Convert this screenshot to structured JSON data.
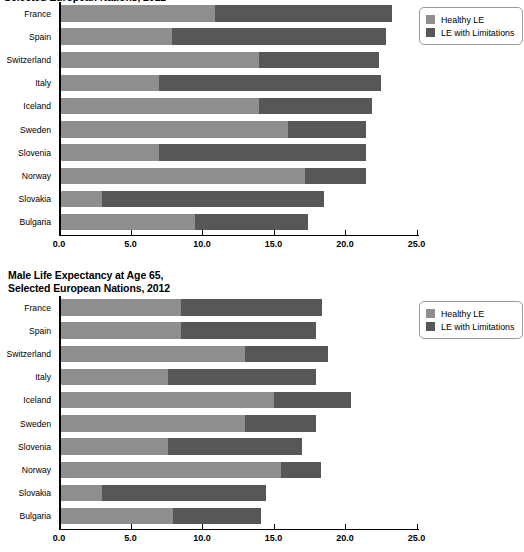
{
  "chart_data": [
    {
      "id": "female",
      "type": "bar",
      "orientation": "horizontal",
      "stacked": true,
      "title": "Female Life Expectancy at Age 65,\nSelected European Nations, 2012",
      "title_visible": false,
      "xlabel": "",
      "ylabel": "",
      "xlim": [
        0.0,
        25.0
      ],
      "xticks": [
        0.0,
        5.0,
        10.0,
        15.0,
        20.0,
        25.0
      ],
      "xtick_labels": [
        "0.0",
        "5.0",
        "10.0",
        "15.0",
        "20.0",
        "25.0"
      ],
      "grid": false,
      "categories": [
        "France",
        "Spain",
        "Switzerland",
        "Italy",
        "Iceland",
        "Sweden",
        "Slovenia",
        "Norway",
        "Slovakia",
        "Bulgaria"
      ],
      "series": [
        {
          "name": "Healthy LE",
          "color": "#8e8e8e",
          "values": [
            10.9,
            7.9,
            14.0,
            7.0,
            14.0,
            16.0,
            7.0,
            17.2,
            3.0,
            9.5
          ]
        },
        {
          "name": "LE with Limitations",
          "color": "#575757",
          "values": [
            12.4,
            15.0,
            8.4,
            15.5,
            7.9,
            5.5,
            14.5,
            4.3,
            15.5,
            7.9
          ]
        }
      ],
      "totals": [
        23.3,
        22.9,
        22.4,
        22.5,
        21.9,
        21.5,
        21.5,
        21.5,
        18.5,
        17.4
      ],
      "legend": {
        "position": "top-right",
        "entries": [
          {
            "label": "Healthy LE",
            "color": "#8e8e8e"
          },
          {
            "label": "LE with Limitations",
            "color": "#575757"
          }
        ]
      }
    },
    {
      "id": "male",
      "type": "bar",
      "orientation": "horizontal",
      "stacked": true,
      "title": "Male Life Expectancy at Age 65,\nSelected European Nations, 2012",
      "title_visible": true,
      "xlabel": "",
      "ylabel": "",
      "xlim": [
        0.0,
        25.0
      ],
      "xticks": [
        0.0,
        5.0,
        10.0,
        15.0,
        20.0,
        25.0
      ],
      "xtick_labels": [
        "0.0",
        "5.0",
        "10.0",
        "15.0",
        "20.0",
        "25.0"
      ],
      "grid": false,
      "categories": [
        "France",
        "Spain",
        "Switzerland",
        "Italy",
        "Iceland",
        "Sweden",
        "Slovenia",
        "Norway",
        "Slovakia",
        "Bulgaria"
      ],
      "series": [
        {
          "name": "Healthy LE",
          "color": "#8e8e8e",
          "values": [
            8.5,
            8.5,
            13.0,
            7.6,
            15.0,
            13.0,
            7.6,
            15.5,
            3.0,
            8.0
          ]
        },
        {
          "name": "LE with Limitations",
          "color": "#575757",
          "values": [
            9.9,
            9.5,
            5.8,
            10.4,
            5.4,
            5.0,
            9.4,
            2.8,
            11.5,
            6.1
          ]
        }
      ],
      "totals": [
        18.4,
        18.0,
        18.8,
        18.0,
        20.4,
        18.0,
        17.0,
        18.3,
        14.5,
        14.1
      ],
      "legend": {
        "position": "top-right",
        "entries": [
          {
            "label": "Healthy LE",
            "color": "#8e8e8e"
          },
          {
            "label": "LE with Limitations",
            "color": "#575757"
          }
        ]
      }
    }
  ]
}
